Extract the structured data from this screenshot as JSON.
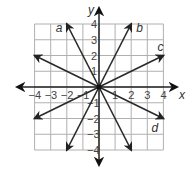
{
  "chart_data": {
    "type": "line",
    "title": "",
    "xlabel": "x",
    "ylabel": "y",
    "xlim": [
      -4,
      4
    ],
    "ylim": [
      -4,
      4
    ],
    "grid": true,
    "x_ticks": [
      "−4",
      "−3",
      "−2",
      "−1",
      "1",
      "2",
      "3",
      "4"
    ],
    "y_ticks": [
      "4",
      "3",
      "2",
      "1",
      "−1",
      "−2",
      "−3",
      "−4"
    ],
    "series": [
      {
        "name": "a",
        "equation": "y = -2x",
        "points": [
          [
            -2,
            4
          ],
          [
            2,
            -4
          ]
        ]
      },
      {
        "name": "b",
        "equation": "y = 2x",
        "points": [
          [
            -2,
            -4
          ],
          [
            2,
            4
          ]
        ]
      },
      {
        "name": "c",
        "equation": "y = 0.5x",
        "points": [
          [
            -4,
            -2
          ],
          [
            4,
            2
          ]
        ]
      },
      {
        "name": "d",
        "equation": "y = -0.5x",
        "points": [
          [
            -4,
            2
          ],
          [
            4,
            -2
          ]
        ]
      }
    ]
  },
  "axes": {
    "x_label": "x",
    "y_label": "y"
  },
  "line_labels": {
    "a": "a",
    "b": "b",
    "c": "c",
    "d": "d"
  },
  "colors": {
    "grid": "#b0b0b0",
    "axis": "#222222",
    "line": "#2a2a2a"
  }
}
